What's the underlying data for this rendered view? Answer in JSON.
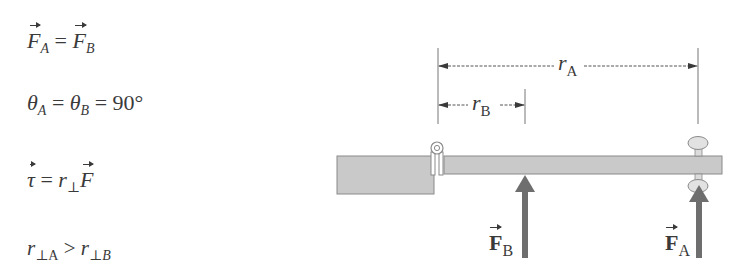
{
  "equations": {
    "eq1": {
      "left_symbol": "F",
      "left_subscript": "A",
      "operator": "=",
      "right_symbol": "F",
      "right_subscript": "B"
    },
    "eq2": {
      "symbol": "θ",
      "sub_a": "A",
      "sub_b": "B",
      "operator": "=",
      "value": "90°"
    },
    "eq3": {
      "left_symbol": "τ",
      "operator": "=",
      "r_symbol": "r",
      "r_subscript": "⊥",
      "f_symbol": "F"
    },
    "eq4": {
      "r_symbol": "r",
      "left_subscript_perp": "⊥",
      "left_subscript": "A",
      "operator": ">",
      "right_subscript_perp": "⊥",
      "right_subscript": "B"
    }
  },
  "diagram": {
    "dimensions": {
      "r_a": {
        "symbol": "r",
        "subscript": "A"
      },
      "r_b": {
        "symbol": "r",
        "subscript": "B"
      }
    },
    "forces": {
      "f_b": {
        "symbol": "F",
        "subscript": "B"
      },
      "f_a": {
        "symbol": "F",
        "subscript": "A"
      }
    },
    "colors": {
      "wall": "#c9c9c9",
      "beam": "#c9c9c9",
      "outline": "#8a8a8a",
      "arrow": "#6e6e6e",
      "dimension_line": "#555555",
      "text": "#3a3a3a"
    }
  }
}
